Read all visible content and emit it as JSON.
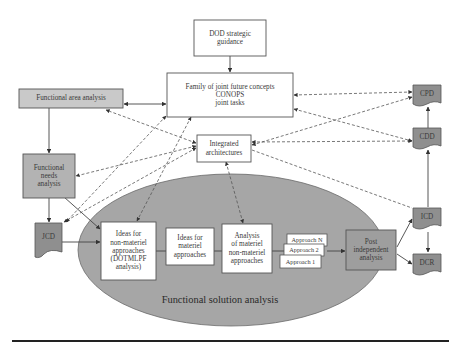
{
  "diagram": {
    "title_visible": "",
    "colors": {
      "box_fill_white": "#ffffff",
      "box_fill_light_gray": "#c9c9c9",
      "box_fill_mid_gray": "#a9a9a9",
      "doc_fill_dark_gray": "#8f8f8f",
      "ellipse_fill": "#a6a6a6",
      "stroke": "#555555",
      "text": "#3a3a3a"
    },
    "nodes": {
      "dod": "DOD strategic\nguidance",
      "family": "Family of joint future concepts\nCONOPS\njoint tasks",
      "faa": "Functional area analysis",
      "ia": "Integrated\narchitectures",
      "fna": "Functional\nneeds\nanalysis",
      "jcd": "JCD",
      "ideas_nonmat": "Ideas for\nnon-materiel\napproaches\n(DOTMLPF\nanalysis)",
      "ideas_mat": "Ideas for\nmateriel\napproaches",
      "analysis": "Analysis\nof materiel\nnon-materiel\napproaches",
      "approach_n": "Approach N",
      "approach_2": "Approach 2",
      "approach_1": "Approach 1",
      "post": "Post\nindependent\nanalysis",
      "cpd": "CPD",
      "cdd": "CDD",
      "icd": "ICD",
      "dcr": "DCR",
      "fsa_label": "Functional solution analysis"
    },
    "edges": [
      {
        "from": "DOD strategic guidance",
        "to": "Family of joint future concepts",
        "style": "solid"
      },
      {
        "from": "Functional area analysis",
        "to": "Family of joint future concepts",
        "style": "solid",
        "bidirectional": true
      },
      {
        "from": "Functional area analysis",
        "to": "Functional needs analysis",
        "style": "solid"
      },
      {
        "from": "Functional needs analysis",
        "to": "JCD",
        "style": "solid"
      },
      {
        "from": "Functional needs analysis",
        "to": "Ideas for non-materiel approaches",
        "style": "solid"
      },
      {
        "from": "JCD",
        "to": "Ideas for non-materiel approaches",
        "style": "solid"
      },
      {
        "from": "Approach set",
        "to": "Post independent analysis",
        "style": "solid"
      },
      {
        "from": "Post independent analysis",
        "to": "ICD",
        "style": "solid"
      },
      {
        "from": "Post independent analysis",
        "to": "DCR",
        "style": "solid"
      },
      {
        "from": "ICD",
        "to": "CDD",
        "style": "solid"
      },
      {
        "from": "CDD",
        "to": "CPD",
        "style": "solid"
      },
      {
        "from": "ICD",
        "to": "DCR",
        "style": "solid"
      },
      {
        "from": "Family of joint future concepts",
        "to": "CPD",
        "style": "dashed",
        "bidirectional": true
      },
      {
        "from": "Family of joint future concepts",
        "to": "CDD",
        "style": "dashed",
        "bidirectional": true
      },
      {
        "from": "Integrated architectures",
        "to": "CPD",
        "style": "dashed",
        "bidirectional": true
      },
      {
        "from": "Integrated architectures",
        "to": "CDD",
        "style": "dashed",
        "bidirectional": true
      },
      {
        "from": "Integrated architectures",
        "to": "ICD",
        "style": "dashed"
      },
      {
        "from": "Integrated architectures",
        "to": "Functional area analysis",
        "style": "dashed",
        "bidirectional": true
      },
      {
        "from": "Integrated architectures",
        "to": "Functional needs analysis",
        "style": "dashed",
        "bidirectional": true
      },
      {
        "from": "Integrated architectures",
        "to": "JCD",
        "style": "dashed",
        "bidirectional": true
      },
      {
        "from": "Integrated architectures",
        "to": "Analysis of materiel non-materiel approaches",
        "style": "dashed",
        "bidirectional": true
      },
      {
        "from": "Family of joint future concepts",
        "to": "JCD",
        "style": "dashed",
        "bidirectional": true
      },
      {
        "from": "Family of joint future concepts",
        "to": "Ideas for non-materiel approaches",
        "style": "dashed",
        "bidirectional": true
      }
    ]
  }
}
